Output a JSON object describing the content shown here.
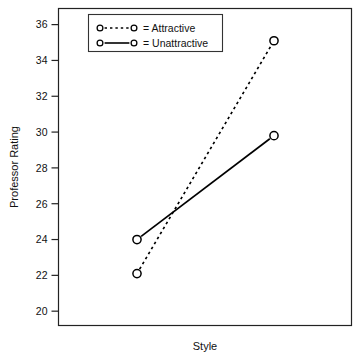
{
  "chart_data": {
    "type": "line",
    "title": "",
    "xlabel": "Style",
    "ylabel": "Professor Rating",
    "categories": [
      "Level 1",
      "Level 2"
    ],
    "ylim": [
      19.2,
      36.9
    ],
    "yticks": [
      20,
      22,
      24,
      26,
      28,
      30,
      32,
      34,
      36
    ],
    "ytick_labels": [
      "20",
      "22",
      "24",
      "26",
      "28",
      "30",
      "32",
      "34",
      "36"
    ],
    "xticks": [],
    "xtick_labels": [],
    "grid": false,
    "legend_position": "top-left inside plot frame",
    "series": [
      {
        "name": "Attractive",
        "legend_text": "= Attractive",
        "linestyle": "dotted",
        "marker": "open-circle",
        "color": "#000000",
        "values": [
          22.1,
          35.1
        ]
      },
      {
        "name": "Unattractive",
        "legend_text": "= Unattractive",
        "linestyle": "solid",
        "marker": "open-circle",
        "color": "#000000",
        "values": [
          24.0,
          29.8
        ]
      }
    ]
  },
  "colors": {
    "frame": "#222222",
    "ink": "#000000",
    "background": "#ffffff",
    "legend_border": "#333333"
  }
}
